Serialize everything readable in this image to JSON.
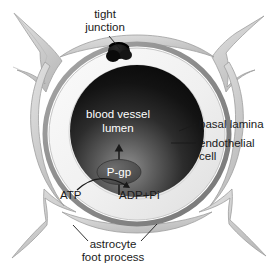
{
  "figure": {
    "background_color": "#ffffff"
  },
  "labels": {
    "tight_junction_line1": "tight",
    "tight_junction_line2": "junction",
    "basal_lamina": "basal lamina",
    "endothelial_line1": "endothelial",
    "endothelial_line2": "cell",
    "lumen_line1": "blood vessel",
    "lumen_line2": "lumen",
    "pump": "P-gp",
    "substrate": "ATP",
    "products": "ADP+Pi",
    "astrocyte_line1": "astrocyte",
    "astrocyte_line2": "foot process"
  },
  "colors": {
    "background": "#ffffff",
    "astrocyte_fill": "#c9c9c9",
    "astrocyte_fill_light": "#dcdcdc",
    "astrocyte_stroke": "#9a9a9a",
    "basal_lamina": "#8e8e8e",
    "endothelial_fill": "#f2f2f2",
    "endothelial_stroke": "#b5b5b5",
    "lumen_dark": "#0d0d0d",
    "lumen_light": "#9a9a9a",
    "tight_junction": "#0a0a0a",
    "pump_fill": "#5a5a5a",
    "text": "#1a1a1a",
    "text_on_dark": "#ffffff"
  },
  "structures": [
    {
      "name": "tight-junction",
      "description": "dark plug at top of endothelial ring"
    },
    {
      "name": "basal-lamina",
      "description": "thin gray outer ring surrounding endothelium"
    },
    {
      "name": "endothelial-cell",
      "description": "pale ring forming the capillary wall"
    },
    {
      "name": "blood-vessel-lumen",
      "description": "dark gradient interior of the capillary"
    },
    {
      "name": "astrocyte-foot-process",
      "description": "gray branched processes wrapping the vessel"
    },
    {
      "name": "p-gp-pump",
      "description": "efflux transporter embedded in endothelial membrane"
    }
  ]
}
